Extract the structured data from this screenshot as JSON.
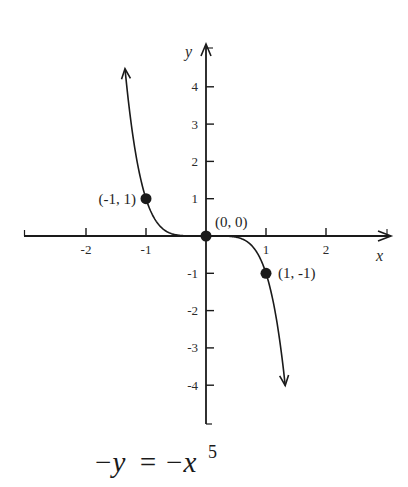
{
  "chart_data": {
    "type": "line",
    "title": "",
    "caption": {
      "lhs": "−y",
      "eq": "=",
      "rhs": "−x",
      "exponent": "5"
    },
    "xlabel": "x",
    "ylabel": "y",
    "xlim": [
      -3,
      3.1
    ],
    "ylim": [
      -5.1,
      5.1
    ],
    "xticks": [
      -2,
      -1,
      1,
      2
    ],
    "xtick_labels": [
      "-2",
      "-1",
      "1",
      "2"
    ],
    "yticks": [
      4,
      3,
      2,
      1,
      -1,
      -2,
      -3,
      -4
    ],
    "ytick_labels": [
      "4",
      "3",
      "2",
      "1",
      "-1",
      "-2",
      "-3",
      "-4"
    ],
    "grid": false,
    "series": [
      {
        "name": "y = -x^5",
        "function": "-x^5",
        "x_range": [
          -1.35,
          1.32
        ],
        "arrows": "both",
        "color": "#1a1a1a"
      }
    ],
    "points": [
      {
        "x": -1,
        "y": 1,
        "label": "(-1, 1)",
        "label_side": "left"
      },
      {
        "x": 0,
        "y": 0,
        "label": "(0, 0)",
        "label_side": "upper-right"
      },
      {
        "x": 1,
        "y": -1,
        "label": "(1, -1)",
        "label_side": "right"
      }
    ],
    "colors": {
      "ink": "#1a1a1a",
      "background": "#ffffff"
    }
  }
}
